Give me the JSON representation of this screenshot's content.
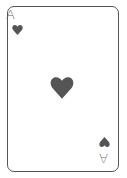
{
  "card": {
    "rank": "A",
    "suit": "hearts",
    "color": "#555555",
    "corner_top_left": {
      "rank": "A",
      "suit_icon": "heart-icon"
    },
    "corner_bottom_right": {
      "rank": "A",
      "suit_icon": "heart-icon",
      "rotated": true
    },
    "center_pip": "heart-icon"
  }
}
